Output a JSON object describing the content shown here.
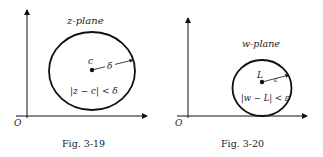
{
  "figures": [
    {
      "plane_label": "z-plane",
      "center_label": "c",
      "radius_label": "δ",
      "inequality": "|z − c| < δ",
      "origin_label": "O",
      "caption": "Fig. 3-19"
    },
    {
      "plane_label": "w-plane",
      "center_label": "L",
      "radius_label": "ε",
      "inequality": "|w − L| < ε",
      "origin_label": "O",
      "caption": "Fig. 3-20"
    }
  ]
}
